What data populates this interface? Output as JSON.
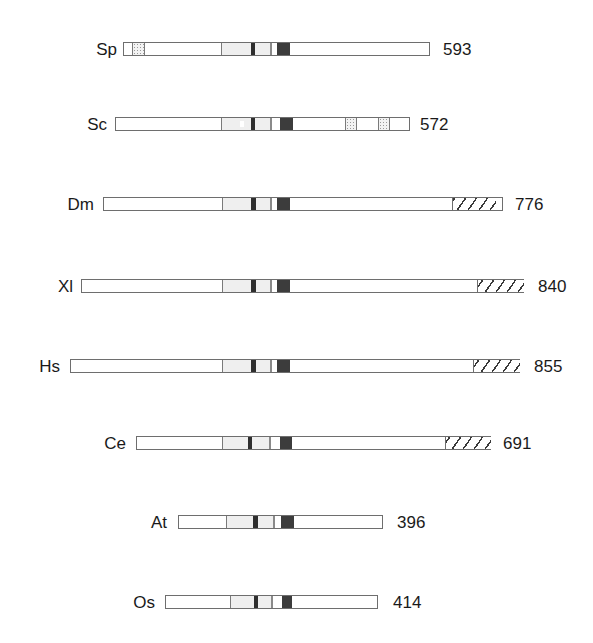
{
  "diagram": {
    "type": "protein-domain-architecture",
    "legend_hint": "light = conserved region, dark = motif, stipple = repeat, hatch = C-terminal extension",
    "rows": [
      {
        "species": "Sp",
        "length_label": "593",
        "y": 40,
        "label_right": 117,
        "bar": [
          123,
          430
        ],
        "len_x": 443,
        "segments": [
          {
            "kind": "stipple",
            "x": [
              132,
              145
            ]
          },
          {
            "kind": "light",
            "x": [
              221,
              271
            ]
          },
          {
            "kind": "darkbar",
            "x": [
              251,
              255
            ]
          },
          {
            "kind": "divider",
            "x": [
              270,
              272
            ]
          },
          {
            "kind": "dark",
            "x": [
              277,
              290
            ]
          }
        ]
      },
      {
        "species": "Sc",
        "length_label": "572",
        "y": 115,
        "label_right": 107,
        "bar": [
          115,
          410
        ],
        "len_x": 420,
        "segments": [
          {
            "kind": "light",
            "x": [
              221,
              271
            ]
          },
          {
            "kind": "notch",
            "x": [
              240,
              244
            ]
          },
          {
            "kind": "darkbar",
            "x": [
              251,
              255
            ]
          },
          {
            "kind": "divider",
            "x": [
              270,
              272
            ]
          },
          {
            "kind": "dark",
            "x": [
              280,
              293
            ]
          },
          {
            "kind": "stipple",
            "x": [
              345,
              357
            ]
          },
          {
            "kind": "stipple",
            "x": [
              378,
              390
            ]
          }
        ]
      },
      {
        "species": "Dm",
        "length_label": "776",
        "y": 195,
        "label_right": 94,
        "bar": [
          103,
          503
        ],
        "len_x": 515,
        "segments": [
          {
            "kind": "light",
            "x": [
              222,
              271
            ]
          },
          {
            "kind": "darkbar",
            "x": [
              251,
              256
            ]
          },
          {
            "kind": "divider",
            "x": [
              270,
              272
            ]
          },
          {
            "kind": "dark",
            "x": [
              277,
              290
            ]
          },
          {
            "kind": "hatch",
            "x": [
              452,
              496
            ]
          }
        ]
      },
      {
        "species": "Xl",
        "length_label": "840",
        "y": 277,
        "label_right": 73,
        "bar": [
          81,
          524
        ],
        "len_x": 538,
        "segments": [
          {
            "kind": "light",
            "x": [
              222,
              271
            ]
          },
          {
            "kind": "darkbar",
            "x": [
              251,
              256
            ]
          },
          {
            "kind": "divider",
            "x": [
              270,
              272
            ]
          },
          {
            "kind": "dark",
            "x": [
              277,
              290
            ]
          },
          {
            "kind": "hatch",
            "x": [
              477,
              524
            ]
          }
        ]
      },
      {
        "species": "Hs",
        "length_label": "855",
        "y": 357,
        "label_right": 60,
        "bar": [
          70,
          520
        ],
        "len_x": 534,
        "segments": [
          {
            "kind": "light",
            "x": [
              222,
              271
            ]
          },
          {
            "kind": "darkbar",
            "x": [
              251,
              256
            ]
          },
          {
            "kind": "divider",
            "x": [
              270,
              272
            ]
          },
          {
            "kind": "dark",
            "x": [
              277,
              290
            ]
          },
          {
            "kind": "hatch",
            "x": [
              473,
              520
            ]
          }
        ]
      },
      {
        "species": "Ce",
        "length_label": "691",
        "y": 434,
        "label_right": 126,
        "bar": [
          136,
          491
        ],
        "len_x": 503,
        "segments": [
          {
            "kind": "light",
            "x": [
              222,
              270
            ]
          },
          {
            "kind": "darkbar",
            "x": [
              248,
              252
            ]
          },
          {
            "kind": "divider",
            "x": [
              269,
              271
            ]
          },
          {
            "kind": "dark",
            "x": [
              280,
              292
            ]
          },
          {
            "kind": "hatch",
            "x": [
              445,
              491
            ]
          }
        ]
      },
      {
        "species": "At",
        "length_label": "396",
        "y": 513,
        "label_right": 167,
        "bar": [
          178,
          383
        ],
        "len_x": 397,
        "segments": [
          {
            "kind": "light",
            "x": [
              226,
              274
            ]
          },
          {
            "kind": "darkbar",
            "x": [
              253,
              258
            ]
          },
          {
            "kind": "divider",
            "x": [
              273,
              275
            ]
          },
          {
            "kind": "dark",
            "x": [
              281,
              294
            ]
          }
        ]
      },
      {
        "species": "Os",
        "length_label": "414",
        "y": 593,
        "label_right": 155,
        "bar": [
          165,
          378
        ],
        "len_x": 393,
        "segments": [
          {
            "kind": "light",
            "x": [
              230,
              272
            ]
          },
          {
            "kind": "darkbar",
            "x": [
              254,
              258
            ]
          },
          {
            "kind": "divider",
            "x": [
              271,
              273
            ]
          },
          {
            "kind": "dark",
            "x": [
              282,
              292
            ]
          }
        ]
      }
    ]
  }
}
